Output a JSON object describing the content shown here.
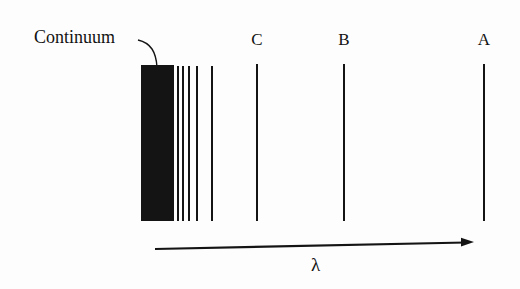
{
  "figure": {
    "background_color": "#fdfdfd",
    "ink_color": "#141414"
  },
  "annotations": {
    "continuum_label": "Continuum",
    "axis_symbol": "λ"
  },
  "series_labels": [
    {
      "text": "C",
      "x": 256
    },
    {
      "text": "B",
      "x": 343
    },
    {
      "text": "A",
      "x": 483
    }
  ],
  "chart_data": {
    "type": "line",
    "xlabel": "λ",
    "ylabel": "",
    "grid": false,
    "legend": null,
    "orientation": "vertical-lines-on-horizontal-wavelength-axis",
    "axis": {
      "symbol": "λ",
      "direction": "increasing wavelength to the right",
      "x_start": 155,
      "x_end": 474,
      "y_start": 249,
      "y_end": 242,
      "arrowhead": "right"
    },
    "continuum": {
      "label": "Continuum",
      "x_left": 141,
      "x_right": 174,
      "y_top": 65,
      "y_bottom": 221,
      "description": "solid filled band at the short-wavelength series limit"
    },
    "lines": [
      {
        "name": "converging-line-1",
        "x": 177,
        "width": 2,
        "y_top": 66,
        "y_bottom": 221,
        "labeled": false
      },
      {
        "name": "converging-line-2",
        "x": 182,
        "width": 2,
        "y_top": 66,
        "y_bottom": 221,
        "labeled": false
      },
      {
        "name": "converging-line-3",
        "x": 188,
        "width": 2,
        "y_top": 66,
        "y_bottom": 221,
        "labeled": false
      },
      {
        "name": "converging-line-4",
        "x": 196,
        "width": 2,
        "y_top": 66,
        "y_bottom": 221,
        "labeled": false
      },
      {
        "name": "converging-line-5",
        "x": 211,
        "width": 2,
        "y_top": 66,
        "y_bottom": 221,
        "labeled": false
      },
      {
        "name": "line-C",
        "x": 256,
        "width": 2,
        "y_top": 64,
        "y_bottom": 221,
        "labeled": true,
        "label": "C"
      },
      {
        "name": "line-B",
        "x": 343,
        "width": 2,
        "y_top": 64,
        "y_bottom": 221,
        "labeled": true,
        "label": "B"
      },
      {
        "name": "line-A",
        "x": 483,
        "width": 2,
        "y_top": 64,
        "y_bottom": 221,
        "labeled": true,
        "label": "A"
      }
    ],
    "leader": {
      "from_x": 138,
      "from_y": 40,
      "to_x": 157,
      "to_y": 67,
      "target": "continuum"
    }
  }
}
